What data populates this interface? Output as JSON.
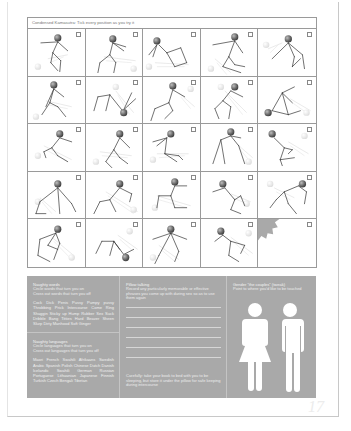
{
  "grid": {
    "title": "Condensed Kamasutra: Tick every position as you try it",
    "positions": [
      {
        "id": 1,
        "checked": false
      },
      {
        "id": 2,
        "checked": false
      },
      {
        "id": 3,
        "checked": false
      },
      {
        "id": 4,
        "checked": false
      },
      {
        "id": 5,
        "checked": false
      },
      {
        "id": 6,
        "checked": false
      },
      {
        "id": 7,
        "checked": false
      },
      {
        "id": 8,
        "checked": false
      },
      {
        "id": 9,
        "checked": false
      },
      {
        "id": 10,
        "checked": false
      },
      {
        "id": 11,
        "checked": false
      },
      {
        "id": 12,
        "checked": false
      },
      {
        "id": 13,
        "checked": false
      },
      {
        "id": 14,
        "checked": false
      },
      {
        "id": 15,
        "checked": false
      },
      {
        "id": 16,
        "checked": false
      },
      {
        "id": 17,
        "checked": false
      },
      {
        "id": 18,
        "checked": false
      },
      {
        "id": 19,
        "checked": false
      },
      {
        "id": 20,
        "checked": false
      },
      {
        "id": 21,
        "checked": false
      },
      {
        "id": 22,
        "checked": false
      },
      {
        "id": 23,
        "checked": false
      },
      {
        "id": 24,
        "checked": false
      }
    ],
    "badge": {
      "text": "Make up your own and draw it here!",
      "icon": "starburst-icon"
    }
  },
  "panel": {
    "naughty_words": {
      "heading": "Naughty words",
      "line1": "Circle words that turn you on",
      "line2": "Cross out words that turn you off",
      "words": "Cock Dick Penis Pussy Pumpy pussy Throbbing Prick Intercourse Come Ring Shaggin Sticky up Hump Rubber Sex Suck Dribble Bang Titties Hard Beaver Sheen Slurp Dirty Manhood Soft Ginger"
    },
    "naughty_languages": {
      "heading": "Naughty languages",
      "line1": "Circle languages that turn you on",
      "line2": "Cross out languages that turn you off",
      "words": "Maori French Swahili Afrikaans Swedish Arabic Spanish Polish Chinese Dutch Danish Icelandic Swahili German Russian Portuguese Lithuanian Japanese Finnish Turkish Czech Bengali Tibetan"
    },
    "pillow_talking": {
      "heading": "Pillow talking",
      "instructions": "Record any particularly memorable or effective phrases you come up with during sex so as to use them again",
      "line_count": 6,
      "footnote": "Carefully: take your book to bed with you to be sleeping, but store it under the pillow for safe keeping during intercourse"
    },
    "gender": {
      "heading": "Gender \"the couples\" (tweak)",
      "instructions": "Point to where you'd like to be touched",
      "figures": [
        "female-figure-icon",
        "male-figure-icon"
      ]
    }
  },
  "page_number": "17"
}
